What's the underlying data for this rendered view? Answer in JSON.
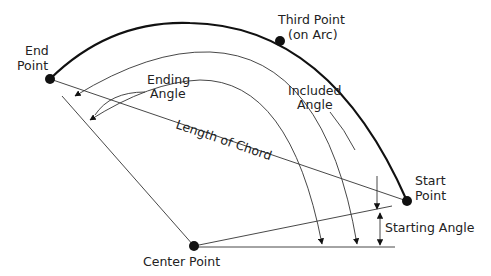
{
  "diagram": {
    "labels": {
      "end_point_line1": "End",
      "end_point_line2": "Point",
      "third_point_line1": "Third Point",
      "third_point_line2": "(on Arc)",
      "ending_angle_line1": "Ending",
      "ending_angle_line2": "Angle",
      "included_angle_line1": "Included",
      "included_angle_line2": "Angle",
      "length_of_chord": "Length of Chord",
      "start_point_line1": "Start",
      "start_point_line2": "Point",
      "starting_angle": "Starting Angle",
      "center_point": "Center Point"
    },
    "points": {
      "end": [
        50,
        79
      ],
      "third": [
        280,
        41
      ],
      "start": [
        407,
        201
      ],
      "center": [
        194,
        246
      ]
    },
    "colors": {
      "stroke": "#333333",
      "arc": "#111111",
      "text": "#222222",
      "background": "#ffffff"
    }
  }
}
